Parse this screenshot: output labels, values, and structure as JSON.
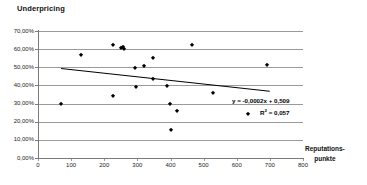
{
  "chart_data": {
    "type": "scatter",
    "title": "Underpricing",
    "xlabel": "Reputations-punkte",
    "xlabel_lines": [
      "Reputations-",
      "punkte"
    ],
    "ylabel": "",
    "xlim": [
      0,
      800
    ],
    "ylim": [
      0,
      0.7
    ],
    "grid": "horizontal",
    "legend": "none",
    "xticks": [
      0,
      100,
      200,
      300,
      400,
      500,
      600,
      700,
      800
    ],
    "xtick_labels": [
      "0",
      "100",
      "200",
      "300",
      "400",
      "500",
      "600",
      "700",
      "800"
    ],
    "yticks": [
      0.0,
      0.1,
      0.2,
      0.3,
      0.4,
      0.5,
      0.6,
      0.7
    ],
    "ytick_labels": [
      "0,00%",
      "10,00%",
      "20,00%",
      "30,00%",
      "40,00%",
      "50,00%",
      "60,00%",
      "70,00%"
    ],
    "marker": "diamond",
    "marker_color": "#000000",
    "points": [
      {
        "x": 70,
        "y": 0.295
      },
      {
        "x": 130,
        "y": 0.565
      },
      {
        "x": 225,
        "y": 0.625
      },
      {
        "x": 225,
        "y": 0.34
      },
      {
        "x": 250,
        "y": 0.605
      },
      {
        "x": 256,
        "y": 0.612
      },
      {
        "x": 261,
        "y": 0.6
      },
      {
        "x": 293,
        "y": 0.495
      },
      {
        "x": 296,
        "y": 0.39
      },
      {
        "x": 320,
        "y": 0.505
      },
      {
        "x": 347,
        "y": 0.55
      },
      {
        "x": 347,
        "y": 0.435
      },
      {
        "x": 390,
        "y": 0.395
      },
      {
        "x": 398,
        "y": 0.298
      },
      {
        "x": 400,
        "y": 0.153
      },
      {
        "x": 420,
        "y": 0.258
      },
      {
        "x": 465,
        "y": 0.625
      },
      {
        "x": 527,
        "y": 0.36
      },
      {
        "x": 633,
        "y": 0.24
      },
      {
        "x": 690,
        "y": 0.51
      }
    ],
    "trendline": {
      "type": "linear",
      "slope": -0.0002,
      "intercept": 0.509,
      "x_start": 70,
      "x_end": 700,
      "equation": "y = -0,0002x + 0,509",
      "r_squared_label": "R",
      "r_squared_exponent": "2",
      "r_squared_value": " = 0,057",
      "r_squared": 0.057,
      "color": "#000000"
    },
    "colors": {
      "axis": "#7a7a7a",
      "grid": "#9a9a9a",
      "text": "#111111",
      "background": "#ffffff"
    }
  }
}
